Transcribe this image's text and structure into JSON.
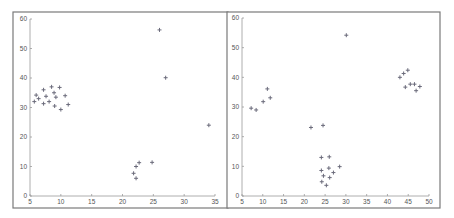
{
  "chart_data": [
    {
      "type": "scatter",
      "title": "",
      "xlabel": "",
      "ylabel": "",
      "xlim": [
        5,
        35
      ],
      "ylim": [
        0,
        60
      ],
      "xticks": [
        5,
        10,
        15,
        20,
        25,
        30,
        35
      ],
      "yticks": [
        0,
        10,
        20,
        30,
        40,
        50,
        60
      ],
      "grid": false,
      "marker": "+",
      "marker_color": "#6a6a7a",
      "series": [
        {
          "name": "points",
          "points": [
            [
              5.7,
              32.0
            ],
            [
              6.0,
              34.2
            ],
            [
              6.4,
              33.0
            ],
            [
              7.2,
              36.0
            ],
            [
              7.2,
              31.3
            ],
            [
              7.6,
              33.8
            ],
            [
              8.1,
              32.0
            ],
            [
              8.5,
              37.0
            ],
            [
              8.9,
              35.0
            ],
            [
              9.0,
              30.5
            ],
            [
              9.2,
              33.5
            ],
            [
              9.8,
              36.8
            ],
            [
              10.0,
              29.3
            ],
            [
              10.7,
              34.0
            ],
            [
              11.2,
              31.0
            ],
            [
              26.0,
              56.3
            ],
            [
              27.0,
              40.1
            ],
            [
              34.0,
              24.0
            ],
            [
              21.8,
              7.7
            ],
            [
              22.2,
              10.0
            ],
            [
              22.2,
              6.0
            ],
            [
              22.7,
              11.3
            ],
            [
              24.8,
              11.4
            ]
          ]
        }
      ]
    },
    {
      "type": "scatter",
      "title": "",
      "xlabel": "",
      "ylabel": "",
      "xlim": [
        5,
        50
      ],
      "ylim": [
        0,
        60
      ],
      "xticks": [
        5,
        10,
        15,
        20,
        25,
        30,
        35,
        40,
        45,
        50
      ],
      "yticks": [
        0,
        10,
        20,
        30,
        40,
        50,
        60
      ],
      "grid": false,
      "marker": "+",
      "marker_color": "#6a6a7a",
      "series": [
        {
          "name": "points",
          "points": [
            [
              7.2,
              29.6
            ],
            [
              8.4,
              29.0
            ],
            [
              10.1,
              31.8
            ],
            [
              11.1,
              36.1
            ],
            [
              11.8,
              33.1
            ],
            [
              21.6,
              23.1
            ],
            [
              24.5,
              23.8
            ],
            [
              30.1,
              54.2
            ],
            [
              24.1,
              13.0
            ],
            [
              26.0,
              13.2
            ],
            [
              24.1,
              8.6
            ],
            [
              24.6,
              6.8
            ],
            [
              24.2,
              4.8
            ],
            [
              25.3,
              3.6
            ],
            [
              25.9,
              9.4
            ],
            [
              26.1,
              6.2
            ],
            [
              27.0,
              7.9
            ],
            [
              28.5,
              9.9
            ],
            [
              43.0,
              40.0
            ],
            [
              43.9,
              41.3
            ],
            [
              44.9,
              42.4
            ],
            [
              44.3,
              36.7
            ],
            [
              45.5,
              37.7
            ],
            [
              46.5,
              37.7
            ],
            [
              46.9,
              35.5
            ],
            [
              47.8,
              36.9
            ]
          ]
        }
      ]
    }
  ],
  "layout": {
    "panels": [
      {
        "frame": [
          13,
          12,
          215,
          196
        ],
        "plot": {
          "x0": 30,
          "x1": 215,
          "y0": 196,
          "y1": 19
        }
      },
      {
        "frame": [
          227,
          12,
          213,
          196
        ],
        "plot": {
          "x0": 242,
          "x1": 429,
          "y0": 196,
          "y1": 18
        }
      }
    ]
  }
}
